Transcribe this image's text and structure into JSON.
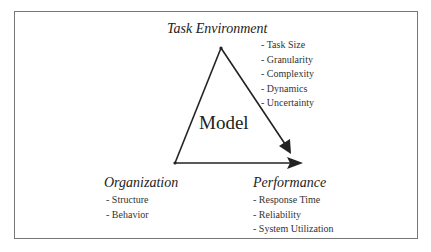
{
  "diagram": {
    "center_label": "Model",
    "nodes": {
      "task_environment": {
        "title": "Task Environment",
        "items": [
          "- Task Size",
          "- Granularity",
          "- Complexity",
          "- Dynamics",
          "- Uncertainty"
        ]
      },
      "organization": {
        "title": "Organization",
        "items": [
          "- Structure",
          "- Behavior"
        ]
      },
      "performance": {
        "title": "Performance",
        "items": [
          "- Response Time",
          "- Reliability",
          "- System Utilization"
        ]
      }
    },
    "edges": [
      {
        "from": "organization",
        "to": "task_environment",
        "arrow": false
      },
      {
        "from": "task_environment",
        "to": "performance",
        "arrow": true
      },
      {
        "from": "organization",
        "to": "performance",
        "arrow": true
      }
    ],
    "colors": {
      "line": "#222222",
      "border": "#777777"
    }
  }
}
